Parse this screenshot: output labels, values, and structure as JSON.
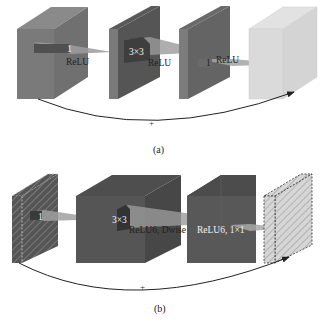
{
  "panel_a": {
    "caption": "(a)",
    "plus": "+",
    "labels": {
      "conv1_kernel": "1",
      "conv1_act": "ReLU",
      "conv2_kernel": "3×3",
      "conv2_act": "ReLU",
      "conv3_kernel": "1",
      "conv3_act": "ReLU"
    }
  },
  "panel_b": {
    "caption": "(b)",
    "plus": "+",
    "labels": {
      "conv1_kernel": "1",
      "conv2_kernel": "3×3",
      "conv2_act": "ReLU6, Dwise",
      "conv3_act": "ReLU6, 1×1"
    }
  },
  "colors": {
    "block_dark": "#4a4a4a",
    "block_mid": "#6e6e6e",
    "block_light": "#d8d8d8",
    "beam": "#9a9a9a",
    "arrow": "#222222",
    "text_light": "#f2f2f2",
    "text_dark": "#222222"
  }
}
